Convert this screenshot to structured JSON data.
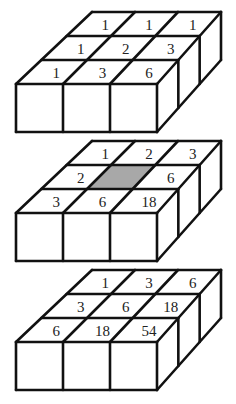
{
  "diagram": {
    "shade_color": "#a8a8a8",
    "layers": [
      {
        "name": "top-layer",
        "grid_back_to_front": [
          [
            "1",
            "1",
            "1"
          ],
          [
            "1",
            "2",
            "3"
          ],
          [
            "1",
            "3",
            "6"
          ]
        ],
        "shaded": []
      },
      {
        "name": "middle-layer",
        "grid_back_to_front": [
          [
            "1",
            "2",
            "3"
          ],
          [
            "2",
            "",
            "6"
          ],
          [
            "3",
            "6",
            "18"
          ]
        ],
        "shaded": [
          [
            1,
            1
          ]
        ]
      },
      {
        "name": "bottom-layer",
        "grid_back_to_front": [
          [
            "1",
            "3",
            "6"
          ],
          [
            "3",
            "6",
            "18"
          ],
          [
            "6",
            "18",
            "54"
          ]
        ],
        "shaded": []
      }
    ]
  }
}
